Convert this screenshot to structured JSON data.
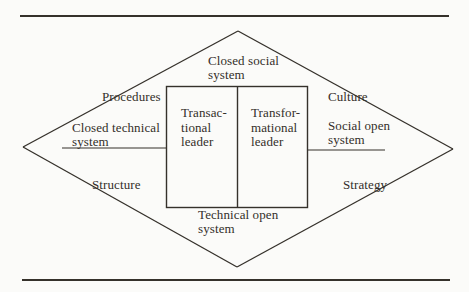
{
  "labels": {
    "closed_social_system": "Closed social\nsystem",
    "procedures": "Procedures",
    "culture": "Culture",
    "closed_technical_system": "Closed technical\nsystem",
    "social_open_system": "Social open\nsystem",
    "structure": "Structure",
    "strategy": "Strategy",
    "technical_open_system": "Technical open\nsystem"
  },
  "box": {
    "left_cell": "Transac-\ntional\nleader",
    "right_cell": "Transfor-\nmational\nleader"
  },
  "colors": {
    "ink": "#35312b",
    "rule": "#2c2b29",
    "paper": "#fbfbf9"
  }
}
